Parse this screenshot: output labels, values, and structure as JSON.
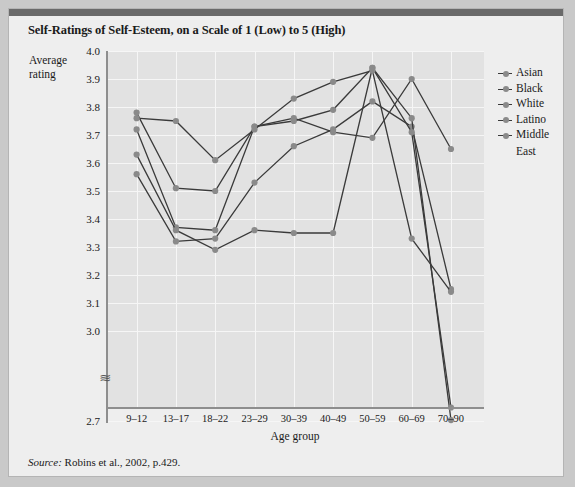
{
  "figure": {
    "title": "Self-Ratings of Self-Esteem, on a Scale of 1 (Low) to 5 (High)",
    "source_prefix": "Source:",
    "source_text": " Robins et al., 2002, p.429.",
    "axis_break_symbol": "≋"
  },
  "chart_data": {
    "type": "line",
    "title": "Self-Ratings of Self-Esteem, on a Scale of 1 (Low) to 5 (High)",
    "xlabel": "Age group",
    "ylabel": "Average rating",
    "categories": [
      "9–12",
      "13–17",
      "18–22",
      "23–29",
      "30–39",
      "40–49",
      "50–59",
      "60–69",
      "70–90"
    ],
    "yticks": [
      "4.0",
      "3.9",
      "3.8",
      "3.7",
      "3.6",
      "3.5",
      "3.4",
      "3.3",
      "3.2",
      "3.1",
      "3.0",
      "2.7"
    ],
    "ylim": [
      3.0,
      4.0
    ],
    "y_axis_broken": true,
    "y_break_value": 2.7,
    "grid": true,
    "legend_position": "right",
    "series": [
      {
        "name": "Asian",
        "color": "#3a3a3a",
        "values": [
          3.56,
          3.32,
          3.33,
          3.53,
          3.66,
          3.72,
          3.82,
          3.73,
          3.15
        ]
      },
      {
        "name": "Black",
        "color": "#3a3a3a",
        "values": [
          3.72,
          3.37,
          3.36,
          3.73,
          3.76,
          3.71,
          3.69,
          3.9,
          3.65
        ]
      },
      {
        "name": "White",
        "color": "#3a3a3a",
        "values": [
          3.63,
          3.36,
          3.29,
          3.36,
          3.35,
          3.35,
          3.94,
          3.76,
          2.72
        ]
      },
      {
        "name": "Latino",
        "color": "#3a3a3a",
        "values": [
          3.78,
          3.51,
          3.5,
          3.73,
          3.75,
          3.79,
          3.94,
          3.71,
          2.99
        ]
      },
      {
        "name": "Middle East",
        "color": "#3a3a3a",
        "values": [
          3.76,
          3.75,
          3.61,
          3.72,
          3.83,
          3.89,
          3.93,
          3.33,
          3.14
        ]
      }
    ]
  }
}
